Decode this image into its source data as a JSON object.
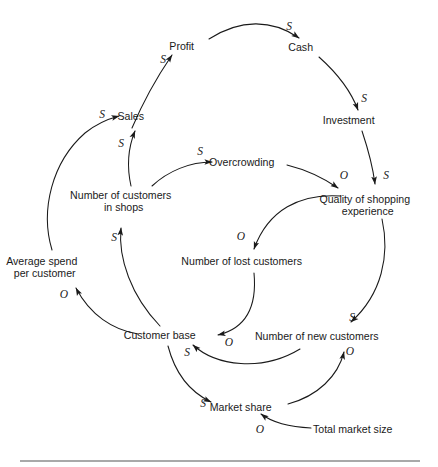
{
  "diagram": {
    "type": "causal-loop-diagram",
    "background_color": "#ffffff",
    "line_color": "#1a1a1a",
    "text_color": "#1a1a1a",
    "nodes": [
      {
        "id": "profit",
        "label": "Profit",
        "lines": [
          "Profit"
        ],
        "x": 192,
        "y": 47
      },
      {
        "id": "cash",
        "label": "Cash",
        "lines": [
          "Cash"
        ],
        "x": 311,
        "y": 48
      },
      {
        "id": "investment",
        "label": "Investment",
        "lines": [
          "Investment"
        ],
        "x": 359,
        "y": 121
      },
      {
        "id": "sales",
        "label": "Sales",
        "lines": [
          "Sales"
        ],
        "x": 141,
        "y": 117
      },
      {
        "id": "overcrowding",
        "label": "Overcrowding",
        "lines": [
          "Overcrowding"
        ],
        "x": 252,
        "y": 163
      },
      {
        "id": "quality",
        "label": "Quality of shopping experience",
        "lines": [
          "Quality of shopping",
          "experience"
        ],
        "x": 378,
        "y": 200
      },
      {
        "id": "customers_in_shops",
        "label": "Number of customers in shops",
        "lines": [
          "Number of customers",
          "in shops"
        ],
        "x": 134,
        "y": 196
      },
      {
        "id": "lost_customers",
        "label": "Number of lost customers",
        "lines": [
          "Number of lost customers"
        ],
        "x": 252,
        "y": 262
      },
      {
        "id": "avg_spend",
        "label": "Average spend per customer",
        "lines": [
          "Average spend",
          "per customer"
        ],
        "x": 55,
        "y": 262
      },
      {
        "id": "customer_base",
        "label": "Customer base",
        "lines": [
          "Customer base"
        ],
        "x": 170,
        "y": 336
      },
      {
        "id": "new_customers",
        "label": "Number of new customers",
        "lines": [
          "Number of new customers"
        ],
        "x": 327,
        "y": 337
      },
      {
        "id": "market_share",
        "label": "Market share",
        "lines": [
          "Market share"
        ],
        "x": 251,
        "y": 408
      },
      {
        "id": "total_market",
        "label": "Total market size",
        "lines": [
          "Total market size"
        ],
        "x": 363,
        "y": 430
      }
    ],
    "links": [
      {
        "id": "sales-profit",
        "from": "sales",
        "to": "profit",
        "polarity": "S",
        "polarity_x": 163,
        "polarity_y": 60
      },
      {
        "id": "profit-cash",
        "from": "profit",
        "to": "cash",
        "polarity": "S",
        "polarity_x": 289,
        "polarity_y": 27
      },
      {
        "id": "cash-investment",
        "from": "cash",
        "to": "investment",
        "polarity": "S",
        "polarity_x": 364,
        "polarity_y": 99
      },
      {
        "id": "investment-quality",
        "from": "investment",
        "to": "quality",
        "polarity": "S",
        "polarity_x": 386,
        "polarity_y": 176
      },
      {
        "id": "customers_in_shops-sales",
        "from": "customers_in_shops",
        "to": "sales",
        "polarity": "S",
        "polarity_x": 121,
        "polarity_y": 144
      },
      {
        "id": "avg_spend-sales",
        "from": "avg_spend",
        "to": "sales",
        "polarity": "S",
        "polarity_x": 102,
        "polarity_y": 115
      },
      {
        "id": "customers_in_shops-overcrowding",
        "from": "customers_in_shops",
        "to": "overcrowding",
        "polarity": "S",
        "polarity_x": 200,
        "polarity_y": 152
      },
      {
        "id": "overcrowding-quality",
        "from": "overcrowding",
        "to": "quality",
        "polarity": "O",
        "polarity_x": 344,
        "polarity_y": 176
      },
      {
        "id": "quality-lost_customers",
        "from": "quality",
        "to": "lost_customers",
        "polarity": "O",
        "polarity_x": 241,
        "polarity_y": 237
      },
      {
        "id": "quality-new_customers",
        "from": "quality",
        "to": "new_customers",
        "polarity": "S",
        "polarity_x": 352,
        "polarity_y": 318
      },
      {
        "id": "lost_customers-customer_base",
        "from": "lost_customers",
        "to": "customer_base",
        "polarity": "O",
        "polarity_x": 229,
        "polarity_y": 343
      },
      {
        "id": "new_customers-customer_base",
        "from": "new_customers",
        "to": "customer_base",
        "polarity": "S",
        "polarity_x": 187,
        "polarity_y": 353
      },
      {
        "id": "customer_base-customers_in_shops",
        "from": "customer_base",
        "to": "customers_in_shops",
        "polarity": "S",
        "polarity_x": 114,
        "polarity_y": 238
      },
      {
        "id": "customer_base-avg_spend",
        "from": "customer_base",
        "to": "avg_spend",
        "polarity": "O",
        "polarity_x": 64,
        "polarity_y": 295
      },
      {
        "id": "customer_base-market_share",
        "from": "customer_base",
        "to": "market_share",
        "polarity": "S",
        "polarity_x": 203,
        "polarity_y": 404
      },
      {
        "id": "market_share-new_customers",
        "from": "market_share",
        "to": "new_customers",
        "polarity": "O",
        "polarity_x": 350,
        "polarity_y": 352
      },
      {
        "id": "total_market-market_share",
        "from": "total_market",
        "to": "market_share",
        "polarity": "O",
        "polarity_x": 260,
        "polarity_y": 430
      }
    ],
    "polarity_legend": {
      "same": "S",
      "opposite": "O"
    }
  }
}
